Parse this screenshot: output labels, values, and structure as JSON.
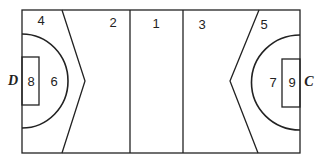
{
  "diagram": {
    "type": "court-zones",
    "zones": [
      {
        "id": "1",
        "label": "1"
      },
      {
        "id": "2",
        "label": "2"
      },
      {
        "id": "3",
        "label": "3"
      },
      {
        "id": "4",
        "label": "4"
      },
      {
        "id": "5",
        "label": "5"
      },
      {
        "id": "6",
        "label": "6"
      },
      {
        "id": "7",
        "label": "7"
      },
      {
        "id": "8",
        "label": "8"
      },
      {
        "id": "9",
        "label": "9"
      }
    ],
    "ends": {
      "left": "D",
      "right": "C"
    },
    "line_color": "#222222"
  }
}
